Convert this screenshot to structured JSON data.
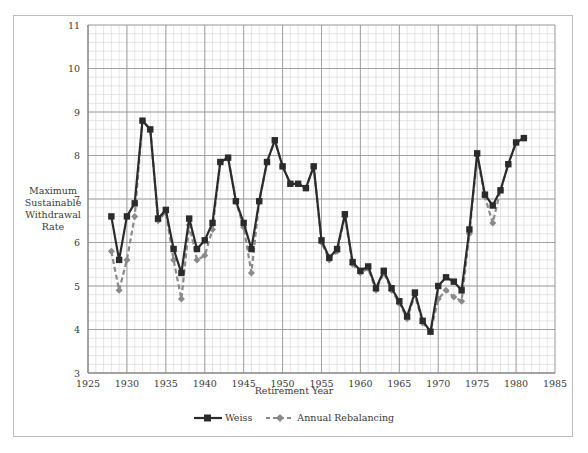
{
  "chart_data": {
    "type": "line",
    "title": "",
    "xlabel": "Retirement Year",
    "ylabel": "Maximum Sustainable Withdrawal Rate",
    "xlim": [
      1925,
      1985
    ],
    "ylim": [
      3,
      11
    ],
    "x_ticks": [
      1925,
      1930,
      1935,
      1940,
      1945,
      1950,
      1955,
      1960,
      1965,
      1970,
      1975,
      1980,
      1985
    ],
    "y_ticks": [
      3,
      4,
      5,
      6,
      7,
      8,
      9,
      10,
      11
    ],
    "grid": true,
    "legend_position": "bottom",
    "x": [
      1928,
      1929,
      1930,
      1931,
      1932,
      1933,
      1934,
      1935,
      1936,
      1937,
      1938,
      1939,
      1940,
      1941,
      1942,
      1943,
      1944,
      1945,
      1946,
      1947,
      1948,
      1949,
      1950,
      1951,
      1952,
      1953,
      1954,
      1955,
      1956,
      1957,
      1958,
      1959,
      1960,
      1961,
      1962,
      1963,
      1964,
      1965,
      1966,
      1967,
      1968,
      1969,
      1970,
      1971,
      1972,
      1973,
      1974,
      1975,
      1976,
      1977,
      1978,
      1979,
      1980,
      1981
    ],
    "series": [
      {
        "name": "Weiss",
        "style": "solid",
        "marker": "square",
        "color": "#2b2b2b",
        "values": [
          6.6,
          5.6,
          6.6,
          6.9,
          8.8,
          8.6,
          6.55,
          6.75,
          5.85,
          5.3,
          6.55,
          5.85,
          6.05,
          6.45,
          7.85,
          7.95,
          6.95,
          6.45,
          5.85,
          6.95,
          7.85,
          8.35,
          7.75,
          7.35,
          7.35,
          7.25,
          7.75,
          6.05,
          5.65,
          5.85,
          6.65,
          5.55,
          5.35,
          5.45,
          4.95,
          5.35,
          4.95,
          4.65,
          4.3,
          4.85,
          4.2,
          3.95,
          5.0,
          5.2,
          5.1,
          4.9,
          6.3,
          8.05,
          7.1,
          6.85,
          7.2,
          7.8,
          8.3,
          8.4
        ]
      },
      {
        "name": "Annual Rebalancing",
        "style": "dashed",
        "marker": "diamond",
        "color": "#8a8a8a",
        "values": [
          5.8,
          4.9,
          5.6,
          6.6,
          8.8,
          8.6,
          6.5,
          6.7,
          5.6,
          4.7,
          6.4,
          5.6,
          5.7,
          6.3,
          7.85,
          7.95,
          6.95,
          6.35,
          5.3,
          6.95,
          7.85,
          8.35,
          7.75,
          7.35,
          7.35,
          7.25,
          7.75,
          6.0,
          5.6,
          5.8,
          6.6,
          5.5,
          5.3,
          5.4,
          4.9,
          5.3,
          4.9,
          4.6,
          4.25,
          4.8,
          4.15,
          3.95,
          4.7,
          4.9,
          4.75,
          4.65,
          6.2,
          8.0,
          7.05,
          6.45,
          7.2,
          7.8,
          8.3,
          8.4
        ]
      }
    ]
  },
  "axis": {
    "ylabel_lines": [
      "Maximum",
      "Sustainable",
      "Withdrawal",
      "Rate"
    ],
    "xlabel": "Retirement Year"
  },
  "legend": {
    "weiss": "Weiss",
    "annual": "Annual Rebalancing"
  }
}
